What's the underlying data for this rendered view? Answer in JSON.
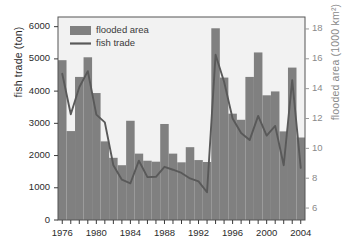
{
  "chart_data": {
    "type": "bar",
    "title": "",
    "subtitle": "",
    "xlabel": "",
    "ylabel": "fish trade (ton)",
    "y2label": "flooded area (1000 km²)",
    "xlim": [
      1975.5,
      2004.5
    ],
    "ylim": [
      0,
      6300
    ],
    "y2lim": [
      5.2,
      18.8
    ],
    "grid": false,
    "legend_position": "top-left",
    "x": [
      1976,
      1977,
      1978,
      1979,
      1980,
      1981,
      1982,
      1983,
      1984,
      1985,
      1986,
      1987,
      1988,
      1989,
      1990,
      1991,
      1992,
      1993,
      1994,
      1995,
      1996,
      1997,
      1998,
      1999,
      2000,
      2001,
      2002,
      2003,
      2004
    ],
    "categories": [
      "1976",
      "1977",
      "1978",
      "1979",
      "1980",
      "1981",
      "1982",
      "1983",
      "1984",
      "1985",
      "1986",
      "1987",
      "1988",
      "1989",
      "1990",
      "1991",
      "1992",
      "1993",
      "1994",
      "1995",
      "1996",
      "1997",
      "1998",
      "1999",
      "2000",
      "2001",
      "2002",
      "2003",
      "2004"
    ],
    "series": [
      {
        "name": "flooded area",
        "type": "bar",
        "axis": "right",
        "units": "1000 km²",
        "color": "#808080",
        "values": [
          15.8,
          11.6,
          14.8,
          16.0,
          13.7,
          10.8,
          10.0,
          9.5,
          11.9,
          10.0,
          9.3,
          9.2,
          11.7,
          10.0,
          9.4,
          10.2,
          9.5,
          9.4,
          18.0,
          15.0,
          12.2,
          11.6,
          15.0,
          16.3,
          13.6,
          13.8,
          11.6,
          15.5,
          11.2
        ]
      },
      {
        "name": "flooded area (left-axis equivalent)",
        "type": "bar",
        "axis": "left",
        "units": "ton-equivalent",
        "color": "#808080",
        "values": [
          4960,
          2760,
          4440,
          5050,
          3940,
          2440,
          1930,
          1700,
          3080,
          2060,
          1840,
          1810,
          2980,
          2060,
          1790,
          2260,
          1860,
          1800,
          5950,
          4420,
          3300,
          3110,
          4440,
          5200,
          3870,
          3990,
          2750,
          4730,
          2560
        ]
      },
      {
        "name": "fish trade",
        "type": "line",
        "axis": "left",
        "units": "ton",
        "color": "#595959",
        "values": [
          4540,
          3280,
          4120,
          4620,
          3270,
          3030,
          1700,
          1250,
          1140,
          1840,
          1330,
          1340,
          1650,
          1560,
          1460,
          1290,
          1200,
          860,
          5130,
          4290,
          3150,
          2700,
          2480,
          3230,
          2620,
          2920,
          1700,
          4340,
          1620
        ]
      }
    ],
    "yticks": [
      0,
      1000,
      2000,
      3000,
      4000,
      5000,
      6000
    ],
    "ytick_labels": [
      "0",
      "1000",
      "2000",
      "3000",
      "4000",
      "5000",
      "6000"
    ],
    "y2ticks": [
      6,
      8,
      10,
      12,
      14,
      16,
      18
    ],
    "y2tick_labels": [
      "6",
      "8",
      "10",
      "12",
      "14",
      "16",
      "18"
    ],
    "xticks_major": [
      1976,
      1980,
      1984,
      1988,
      1992,
      1996,
      2000,
      2004
    ],
    "xtick_labels": [
      "1976",
      "1980",
      "1984",
      "1988",
      "1992",
      "1996",
      "2000",
      "2004"
    ],
    "legend": [
      {
        "label": "flooded area",
        "marker": "swatch",
        "color": "#808080"
      },
      {
        "label": "fish trade",
        "marker": "line",
        "color": "#595959"
      }
    ],
    "colors": {
      "bar": "#808080",
      "line": "#595959",
      "plot_background": "#f2f2f2",
      "frame": "#555555",
      "left_axis_text": "#2b2b2b",
      "right_axis_text": "#8a8a8a"
    }
  }
}
